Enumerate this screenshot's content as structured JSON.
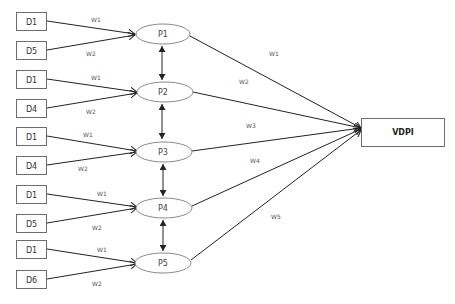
{
  "diagram": {
    "inputs": [
      {
        "label": "D1",
        "target": "P1",
        "weight": "W1"
      },
      {
        "label": "D5",
        "target": "P1",
        "weight": "W2"
      },
      {
        "label": "D1",
        "target": "P2",
        "weight": "W1"
      },
      {
        "label": "D4",
        "target": "P2",
        "weight": "W2"
      },
      {
        "label": "D1",
        "target": "P3",
        "weight": "W1"
      },
      {
        "label": "D4",
        "target": "P3",
        "weight": "W2"
      },
      {
        "label": "D1",
        "target": "P4",
        "weight": "W1"
      },
      {
        "label": "D5",
        "target": "P4",
        "weight": "W2"
      },
      {
        "label": "D1",
        "target": "P5",
        "weight": "W1"
      },
      {
        "label": "D6",
        "target": "P5",
        "weight": "W2"
      }
    ],
    "processes": [
      {
        "label": "P1",
        "output_weight": "W1"
      },
      {
        "label": "P2",
        "output_weight": "W2"
      },
      {
        "label": "P3",
        "output_weight": "W3"
      },
      {
        "label": "P4",
        "output_weight": "W4"
      },
      {
        "label": "P5",
        "output_weight": "W5"
      }
    ],
    "output": {
      "label": "VDPI"
    },
    "colors": {
      "line": "#222222",
      "box_border": "#6d6d6d",
      "ellipse_border": "#8a8a8a",
      "background": "#ffffff"
    }
  }
}
